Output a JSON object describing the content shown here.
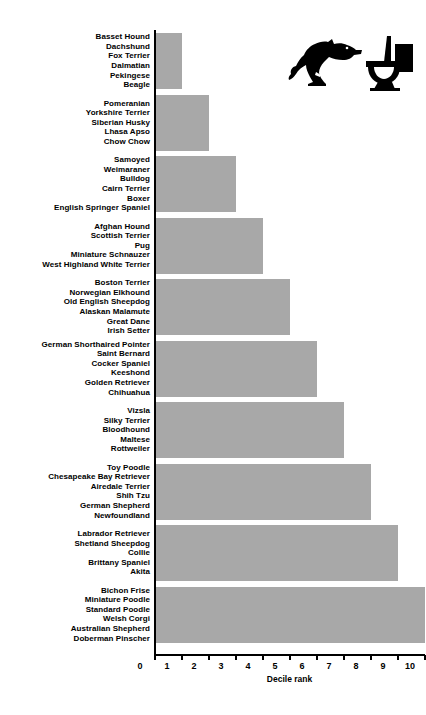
{
  "chart_data": {
    "type": "bar",
    "orientation": "horizontal",
    "title": "",
    "xlabel": "Decile rank",
    "ylabel": "",
    "xlim": [
      0,
      10
    ],
    "xticks": [
      0,
      1,
      2,
      3,
      4,
      5,
      6,
      7,
      8,
      9,
      10
    ],
    "grid": false,
    "legend": false,
    "bar_color": "#a8a8a8",
    "categories": [
      "Basset Hound, Dachshund, Fox Terrier, Dalmatian, Pekingese, Beagle",
      "Pomeranian, Yorkshire Terrier, Siberian Husky, Lhasa Apso, Chow Chow",
      "Samoyed, Weimaraner, Bulldog, Cairn Terrier, Boxer, English Springer Spaniel",
      "Afghan Hound, Scottish Terrier, Pug, Miniature Schnauzer, West Highland White Terrier",
      "Boston Terrier, Norwegian Elkhound, Old English Sheepdog, Alaskan Malamute, Great Dane, Irish Setter",
      "German Shorthaired Pointer, Saint Bernard, Cocker Spaniel, Keeshond, Golden Retriever, Chihuahua",
      "Vizsla, Silky Terrier, Bloodhound, Maltese, Rottweiler",
      "Toy Poodle, Chesapeake Bay Retriever, Airedale Terrier, Shih Tzu, German Shepherd, Newfoundland",
      "Labrador Retriever, Shetland Sheepdog, Collie, Brittany Spaniel, Akita",
      "Bichon Frise, Miniature Poodle, Standard Poodle, Welsh Corgi, Australian Shepherd, Doberman Pinscher"
    ],
    "values": [
      1,
      2,
      3,
      4,
      5,
      6,
      7,
      8,
      9,
      10
    ]
  },
  "groups": [
    {
      "value": 1,
      "breeds": [
        "Basset Hound",
        "Dachshund",
        "Fox Terrier",
        "Dalmatian",
        "Pekingese",
        "Beagle"
      ]
    },
    {
      "value": 2,
      "breeds": [
        "Pomeranian",
        "Yorkshire Terrier",
        "Siberian Husky",
        "Lhasa Apso",
        "Chow Chow"
      ]
    },
    {
      "value": 3,
      "breeds": [
        "Samoyed",
        "Weimaraner",
        "Bulldog",
        "Cairn Terrier",
        "Boxer",
        "English Springer Spaniel"
      ]
    },
    {
      "value": 4,
      "breeds": [
        "Afghan Hound",
        "Scottish Terrier",
        "Pug",
        "Miniature Schnauzer",
        "West Highland White Terrier"
      ]
    },
    {
      "value": 5,
      "breeds": [
        "Boston Terrier",
        "Norwegian Elkhound",
        "Old English Sheepdog",
        "Alaskan Malamute",
        "Great Dane",
        "Irish Setter"
      ]
    },
    {
      "value": 6,
      "breeds": [
        "German Shorthaired Pointer",
        "Saint Bernard",
        "Cocker Spaniel",
        "Keeshond",
        "Golden Retriever",
        "Chihuahua"
      ]
    },
    {
      "value": 7,
      "breeds": [
        "Vizsla",
        "Silky Terrier",
        "Bloodhound",
        "Maltese",
        "Rottweiler"
      ]
    },
    {
      "value": 8,
      "breeds": [
        "Toy Poodle",
        "Chesapeake Bay Retriever",
        "Airedale Terrier",
        "Shih Tzu",
        "German Shepherd",
        "Newfoundland"
      ]
    },
    {
      "value": 9,
      "breeds": [
        "Labrador Retriever",
        "Shetland Sheepdog",
        "Collie",
        "Brittany Spaniel",
        "Akita"
      ]
    },
    {
      "value": 10,
      "breeds": [
        "Bichon Frise",
        "Miniature Poodle",
        "Standard Poodle",
        "Welsh Corgi",
        "Australian Shepherd",
        "Doberman Pinscher"
      ]
    }
  ],
  "axis": {
    "x_title": "Decile rank",
    "x_tick_labels": [
      "0",
      "1",
      "2",
      "3",
      "4",
      "5",
      "6",
      "7",
      "8",
      "9",
      "10"
    ]
  },
  "decoration": {
    "icon_name": "dog-and-toilet-illustration",
    "color": "#000000"
  }
}
